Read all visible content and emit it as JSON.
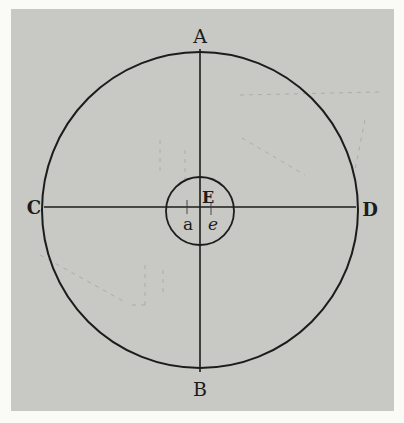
{
  "figure": {
    "colors": {
      "page_background": "#fafaf7",
      "plate": "#c8c8c4",
      "ink": "#1c1c1c",
      "faint_ink": "#8e8e8a"
    },
    "outer_circle": {
      "cx": 200,
      "cy": 210,
      "r": 158
    },
    "inner_circle": {
      "cx": 200,
      "cy": 211,
      "r": 34
    },
    "vertical_diameter": {
      "x": 200,
      "y1": 49,
      "y2": 372
    },
    "horizontal_diameter": {
      "y": 207,
      "x1": 44,
      "x2": 356
    },
    "labels": {
      "top": "A",
      "bottom": "B",
      "left": "C",
      "right": "D",
      "center": "E",
      "inner_left": "a",
      "inner_right": "e"
    }
  }
}
